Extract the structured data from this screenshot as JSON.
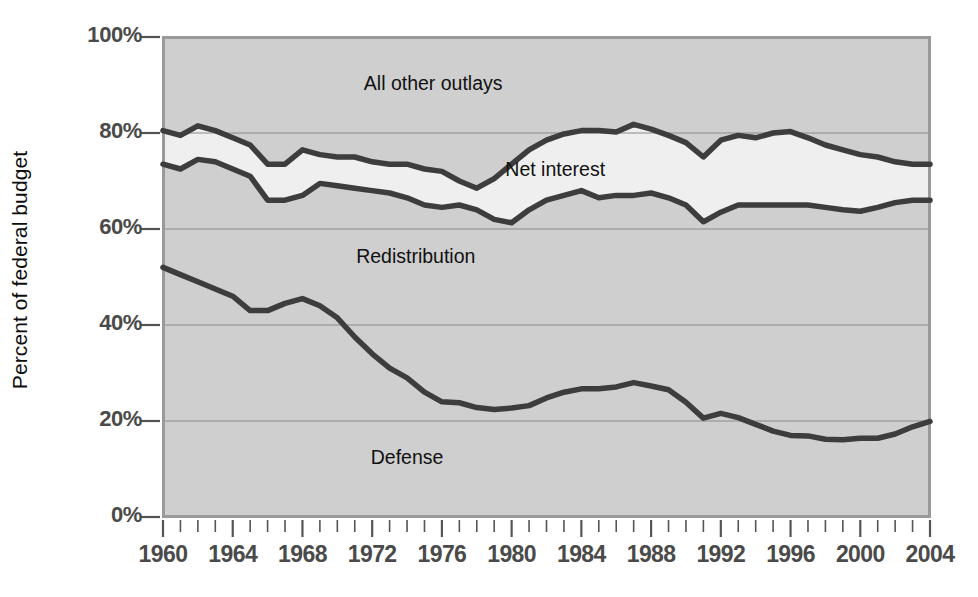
{
  "chart_data": {
    "type": "area",
    "title": "",
    "subtitle": "",
    "xlabel": "",
    "ylabel": "Percent of federal budget",
    "xlim": [
      1960,
      2004
    ],
    "ylim": [
      0,
      100
    ],
    "grid": true,
    "legend_position": "inline-annotations",
    "y_ticks": [
      "0%",
      "20%",
      "40%",
      "60%",
      "80%",
      "100%"
    ],
    "y_tick_values": [
      0,
      20,
      40,
      60,
      80,
      100
    ],
    "x_ticks": [
      "1960",
      "1964",
      "1968",
      "1972",
      "1976",
      "1980",
      "1984",
      "1988",
      "1992",
      "1996",
      "2000",
      "2004"
    ],
    "x_tick_values": [
      1960,
      1964,
      1968,
      1972,
      1976,
      1980,
      1984,
      1988,
      1992,
      1996,
      2000,
      2004
    ],
    "x_minor_tick_step": 1,
    "annotations": [
      {
        "text": "All other outlays",
        "x": 1975.5,
        "y": 90
      },
      {
        "text": "Net interest",
        "x": 1982.5,
        "y": 72
      },
      {
        "text": "Redistribution",
        "x": 1974.5,
        "y": 54
      },
      {
        "text": "Defense",
        "x": 1974.0,
        "y": 12
      }
    ],
    "x": [
      1960,
      1961,
      1962,
      1963,
      1964,
      1965,
      1966,
      1967,
      1968,
      1969,
      1970,
      1971,
      1972,
      1973,
      1974,
      1975,
      1976,
      1977,
      1978,
      1979,
      1980,
      1981,
      1982,
      1983,
      1984,
      1985,
      1986,
      1987,
      1988,
      1989,
      1990,
      1991,
      1992,
      1993,
      1994,
      1995,
      1996,
      1997,
      1998,
      1999,
      2000,
      2001,
      2002,
      2003,
      2004
    ],
    "series": [
      {
        "name": "Defense",
        "note": "Cumulative boundary: top of Defense band (bottom line on chart)",
        "values": [
          52.0,
          50.5,
          49.0,
          47.5,
          46.0,
          43.0,
          43.0,
          44.5,
          45.5,
          44.0,
          41.5,
          37.5,
          34.0,
          31.0,
          29.0,
          26.0,
          24.0,
          23.8,
          22.8,
          22.4,
          22.7,
          23.2,
          24.8,
          26.0,
          26.7,
          26.7,
          27.1,
          28.0,
          27.3,
          26.5,
          23.9,
          20.6,
          21.6,
          20.7,
          19.3,
          17.9,
          17.0,
          16.9,
          16.2,
          16.1,
          16.4,
          16.4,
          17.3,
          18.8,
          19.9
        ],
        "values_description": "Defense share of federal budget (%)"
      },
      {
        "name": "Redistribution",
        "note": "Cumulative boundary: top of Redistribution band (middle line on chart)",
        "values": [
          73.5,
          72.5,
          74.5,
          74.0,
          72.5,
          71.0,
          66.0,
          66.0,
          67.0,
          69.5,
          69.0,
          68.5,
          68.0,
          67.5,
          66.5,
          65.0,
          64.5,
          65.0,
          64.0,
          62.0,
          61.3,
          64.0,
          66.0,
          67.0,
          68.0,
          66.5,
          67.0,
          67.0,
          67.5,
          66.5,
          65.0,
          61.5,
          63.5,
          65.0,
          65.0,
          65.0,
          65.0,
          65.0,
          64.5,
          64.0,
          63.7,
          64.5,
          65.5,
          66.0,
          66.0
        ],
        "values_description": "Cumulative: Defense + Redistribution share (%)"
      },
      {
        "name": "Net interest",
        "note": "Cumulative boundary: top of Net interest band (top line on chart)",
        "values": [
          80.5,
          79.5,
          81.5,
          80.5,
          79.0,
          77.5,
          73.5,
          73.5,
          76.5,
          75.5,
          75.0,
          75.0,
          74.0,
          73.5,
          73.5,
          72.5,
          72.0,
          70.0,
          68.5,
          70.5,
          73.5,
          76.5,
          78.5,
          79.8,
          80.5,
          80.5,
          80.2,
          81.8,
          80.8,
          79.5,
          78.0,
          75.0,
          78.5,
          79.5,
          79.0,
          80.0,
          80.3,
          79.0,
          77.5,
          76.5,
          75.5,
          75.0,
          74.0,
          73.5,
          73.5
        ],
        "values_description": "Cumulative: Defense + Redistribution + Net interest share (%)"
      },
      {
        "name": "All other outlays",
        "note": "Fills from the Net interest boundary to 100%",
        "values": [
          19.5,
          20.5,
          18.5,
          19.5,
          21.0,
          22.5,
          26.5,
          26.5,
          23.5,
          24.5,
          25.0,
          25.0,
          26.0,
          26.5,
          26.5,
          27.5,
          28.0,
          30.0,
          31.5,
          29.5,
          26.5,
          23.5,
          21.5,
          20.2,
          19.5,
          19.5,
          19.8,
          18.2,
          19.2,
          20.5,
          22.0,
          25.0,
          21.5,
          20.5,
          21.0,
          20.0,
          19.7,
          21.0,
          22.5,
          23.5,
          24.5,
          25.0,
          26.0,
          26.5,
          26.5
        ],
        "values_description": "All other outlays share (%)"
      }
    ],
    "colors": {
      "band_default": "#cfcfcf",
      "band_net_interest": "#efefef",
      "line": "#3d3d3d",
      "gridline": "#8a8a8a",
      "plot_border": "#9a9a9a",
      "axis_text": "#4a4a4a",
      "annotation_text": "#111111"
    }
  }
}
